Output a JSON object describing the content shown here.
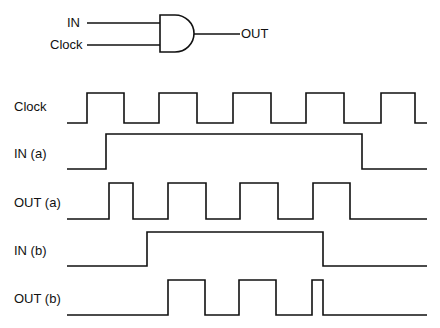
{
  "gate": {
    "type": "AND",
    "inputs": [
      "IN",
      "Clock"
    ],
    "output": "OUT"
  },
  "signals": [
    {
      "label": "Clock",
      "low_y": 123,
      "high_y": 93,
      "start_x": 67,
      "end_x": 427,
      "start_level": 0,
      "transitions": [
        87,
        124,
        159,
        197,
        233,
        271,
        306,
        344,
        381,
        415
      ]
    },
    {
      "label": "IN (a)",
      "low_y": 169,
      "high_y": 134,
      "start_x": 67,
      "end_x": 427,
      "start_level": 0,
      "transitions": [
        106,
        362
      ]
    },
    {
      "label": "OUT (a)",
      "low_y": 219,
      "high_y": 183,
      "start_x": 67,
      "end_x": 427,
      "start_level": 0,
      "transitions": [
        109,
        133,
        168,
        206,
        240,
        278,
        313,
        350
      ]
    },
    {
      "label": "IN (b)",
      "low_y": 266,
      "high_y": 232,
      "start_x": 67,
      "end_x": 427,
      "start_level": 0,
      "transitions": [
        147,
        323
      ]
    },
    {
      "label": "OUT (b)",
      "low_y": 315,
      "high_y": 280,
      "start_x": 67,
      "end_x": 427,
      "start_level": 0,
      "transitions": [
        168,
        205,
        239,
        276,
        312,
        323
      ]
    }
  ],
  "colors": {
    "line": "#111111",
    "background": "#ffffff"
  }
}
